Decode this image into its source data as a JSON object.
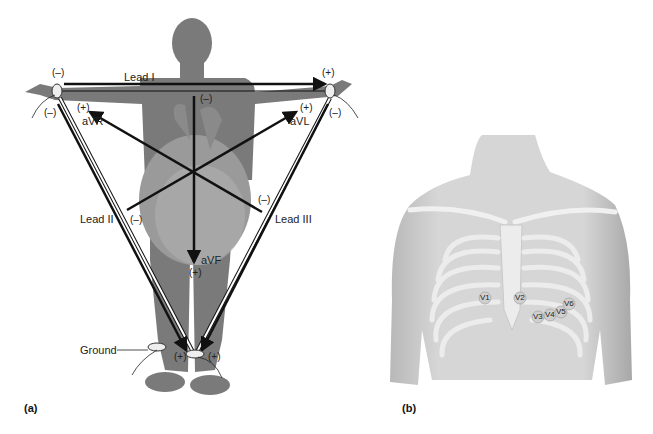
{
  "panel_a": {
    "letter": "(a)",
    "leads": {
      "lead_i": "Lead I",
      "lead_ii": "Lead II",
      "lead_iii": "Lead III",
      "avr": "aVR",
      "avl": "aVL",
      "avf": "aVF"
    },
    "polarity": {
      "right_arm_top": "(–)",
      "right_arm_bottom": "(–)",
      "left_arm_top": "(+)",
      "left_arm_bottom": "(–)",
      "avr_plus": "(+)",
      "avl_plus": "(+)",
      "avf_minus": "(–)",
      "avf_plus": "(+)",
      "lead_ii_minus": "(–)",
      "lead_iii_minus": "(–)",
      "left_leg_left": "(+)",
      "left_leg_right": "(+)"
    },
    "ground_label": "Ground"
  },
  "panel_b": {
    "letter": "(b)",
    "electrodes": [
      "V1",
      "V2",
      "V3",
      "V4",
      "V5",
      "V6"
    ]
  },
  "colors": {
    "silhouette": "#7a7a7a",
    "torso_skin": "#d4d4d4",
    "bone": "#e8e8e8",
    "lead_line": "#111111"
  }
}
